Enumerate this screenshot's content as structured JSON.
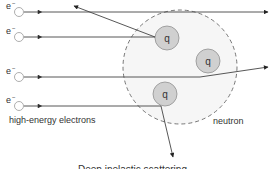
{
  "diagram": {
    "electron_label": "e",
    "electron_charge": "−",
    "quark_label": "q",
    "electrons_caption": "high-energy electrons",
    "neutron_caption": "neutron",
    "bottom_caption": "Deep inelastic scattering"
  },
  "colors": {
    "line": "#333333",
    "quark_fill": "#d0d0d0",
    "quark_stroke": "#909090",
    "neutron_fill": "#f6f6f6",
    "neutron_stroke": "#555555",
    "electron_stroke": "#999999"
  }
}
